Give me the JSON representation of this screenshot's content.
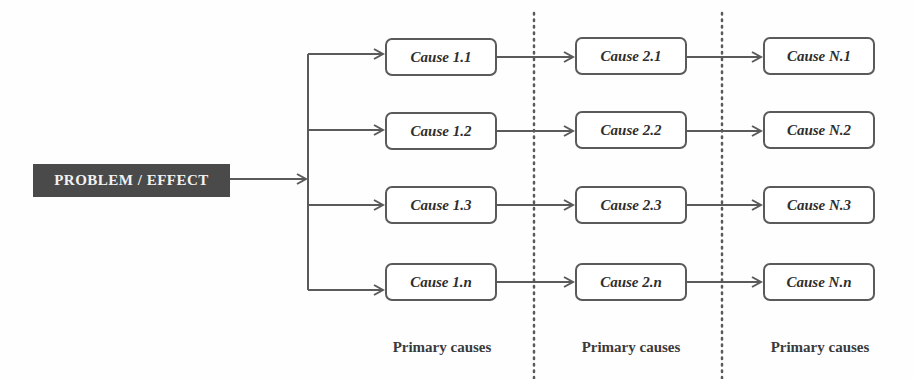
{
  "diagram": {
    "type": "cause-effect tree",
    "problem": {
      "label": "PROBLEM / EFFECT"
    },
    "columns": [
      {
        "label": "Primary causes",
        "causes": [
          "Cause 1.1",
          "Cause 1.2",
          "Cause 1.3",
          "Cause 1.n"
        ]
      },
      {
        "label": "Primary causes",
        "causes": [
          "Cause 2.1",
          "Cause 2.2",
          "Cause 2.3",
          "Cause 2.n"
        ]
      },
      {
        "label": "Primary causes",
        "causes": [
          "Cause N.1",
          "Cause N.2",
          "Cause N.3",
          "Cause N.n"
        ]
      }
    ],
    "colors": {
      "problem_bg": "#4a4a4a",
      "problem_text": "#f2f2f2",
      "line": "#5a5a5a",
      "text": "#2e2e2e"
    }
  }
}
